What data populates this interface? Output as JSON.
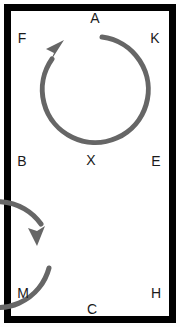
{
  "figure": {
    "background_color": "#ffffff",
    "frame_color": "#000000",
    "frame_thickness_px": 7,
    "stroke_color": "#666666",
    "label_color": "#1a1a1a"
  },
  "diagrams": [
    {
      "name": "top-circle",
      "direction": "clockwise",
      "center_x": 90,
      "center_y": 89,
      "radius": 53,
      "arrowhead_position": "upper-left",
      "gap_position": "top"
    },
    {
      "name": "bottom-circle",
      "direction": "counterclockwise",
      "center_x": 90,
      "center_y": 238,
      "radius": 53,
      "arrowhead_position": "left",
      "gap_position": "left"
    }
  ],
  "labels": [
    {
      "text": "A",
      "x": 95,
      "y": 18,
      "name": "label-a"
    },
    {
      "text": "F",
      "x": 22,
      "y": 38,
      "name": "label-f"
    },
    {
      "text": "K",
      "x": 155,
      "y": 38,
      "name": "label-k"
    },
    {
      "text": "B",
      "x": 22,
      "y": 161,
      "name": "label-b"
    },
    {
      "text": "X",
      "x": 91,
      "y": 160,
      "name": "label-x"
    },
    {
      "text": "E",
      "x": 156,
      "y": 161,
      "name": "label-e"
    },
    {
      "text": "M",
      "x": 23,
      "y": 293,
      "name": "label-m"
    },
    {
      "text": "H",
      "x": 156,
      "y": 293,
      "name": "label-h"
    },
    {
      "text": "C",
      "x": 92,
      "y": 309,
      "name": "label-c"
    }
  ]
}
